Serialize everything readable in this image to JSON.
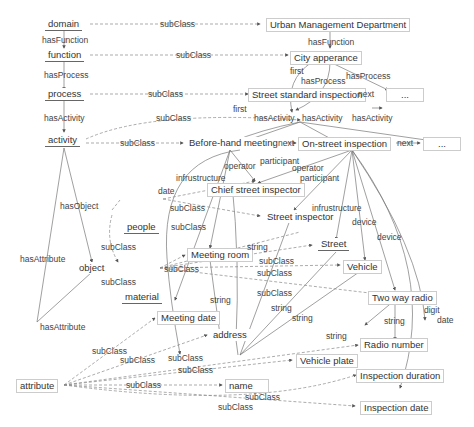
{
  "nodes": {
    "domain": "domain",
    "function": "function",
    "process": "process",
    "activity": "activity",
    "object": "object",
    "attribute": "attribute",
    "urban": "Urban Management Department",
    "city": "City apperance",
    "ssi": "Street standard inspection",
    "ellipsis1": "...",
    "before": "Before-hand meeting",
    "onstreet": "On-street inspection",
    "ellipsis2": "...",
    "chief": "Chief street inspector",
    "streetinsp": "Street inspector",
    "people": "people",
    "meetingroom": "Meeting room",
    "street": "Street",
    "vehicle": "Vehicle",
    "material": "material",
    "radio": "Two way radio",
    "meetingdate": "Meeting date",
    "address": "address",
    "radionumber": "Radio number",
    "vehicleplate": "Vehicle plate",
    "name": "name",
    "duration": "Inspection duration",
    "inspdate": "Inspection date"
  },
  "labels": {
    "hasFunction": "hasFunction",
    "hasProcess": "hasProcess",
    "hasActivity": "hasActivity",
    "hasObject": "hasObject",
    "hasAttribute": "hasAttribute",
    "subClass": "subClass",
    "first": "first",
    "next": "next",
    "operator": "operator",
    "participant": "participant",
    "infrustructure": "infrustructure",
    "date": "date",
    "device": "device",
    "string": "string",
    "digit": "digit"
  }
}
